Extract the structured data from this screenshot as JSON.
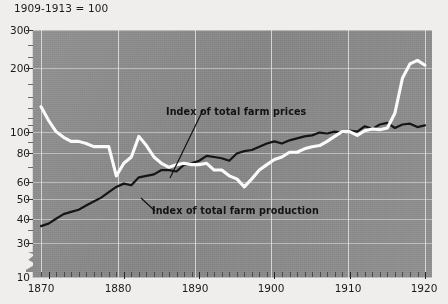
{
  "figure": {
    "title": "1909-1913 = 100",
    "background_color": "#efeeec",
    "plot_background_color": "#8b8b8b"
  },
  "annotations": {
    "prices_label": "Index of total farm prices",
    "production_label": "Index of total farm production"
  },
  "axes": {
    "y_labels": [
      "300",
      "200",
      "100",
      "80",
      "60",
      "50",
      "40",
      "30",
      "10"
    ],
    "x_labels": [
      "1870",
      "1880",
      "1890",
      "1900",
      "1910",
      "1920"
    ]
  },
  "chart_data": {
    "type": "line",
    "title": "1909-1913 = 100",
    "subtitle": "",
    "xlabel": "",
    "ylabel": "",
    "yscale": "log",
    "ylim": [
      28,
      320
    ],
    "xlim": [
      1869,
      1920
    ],
    "yticks": [
      30,
      40,
      50,
      60,
      80,
      100,
      200,
      300
    ],
    "ytick_labels": [
      "30",
      "40",
      "50",
      "60",
      "80",
      "100",
      "200",
      "300"
    ],
    "y_axis_break_below": 30,
    "y_axis_break_label": "10",
    "xticks": [
      1870,
      1880,
      1890,
      1900,
      1910,
      1920
    ],
    "xtick_labels": [
      "1870",
      "1880",
      "1890",
      "1900",
      "1910",
      "1920"
    ],
    "x_minor_tick_interval": 1,
    "grid": true,
    "legend": "inline-annotations",
    "legend_position": "inside-plot",
    "series": [
      {
        "name": "Index of total farm prices",
        "color": "#fbfbfb",
        "linewidth": 3.1,
        "x": [
          1869,
          1870,
          1871,
          1872,
          1873,
          1874,
          1875,
          1876,
          1877,
          1878,
          1879,
          1880,
          1881,
          1882,
          1883,
          1884,
          1885,
          1886,
          1887,
          1888,
          1889,
          1890,
          1891,
          1892,
          1893,
          1894,
          1895,
          1896,
          1897,
          1898,
          1899,
          1900,
          1901,
          1902,
          1903,
          1904,
          1905,
          1906,
          1907,
          1908,
          1909,
          1910,
          1911,
          1912,
          1913,
          1914,
          1915,
          1916,
          1917,
          1918,
          1919,
          1920
        ],
        "values": [
          131,
          113,
          100,
          94,
          90,
          90,
          88,
          85,
          85,
          85,
          62,
          71,
          76,
          95,
          86,
          76,
          71,
          68,
          70,
          71,
          70,
          70,
          71,
          66,
          66,
          62,
          60,
          55,
          60,
          66,
          70,
          74,
          76,
          80,
          80,
          83,
          85,
          86,
          90,
          95,
          100,
          100,
          96,
          101,
          103,
          102,
          104,
          122,
          178,
          208,
          216,
          205
        ]
      },
      {
        "name": "Index of total farm production",
        "color": "#151515",
        "linewidth": 2.2,
        "x": [
          1869,
          1870,
          1871,
          1872,
          1873,
          1874,
          1875,
          1876,
          1877,
          1878,
          1879,
          1880,
          1881,
          1882,
          1883,
          1884,
          1885,
          1886,
          1887,
          1888,
          1889,
          1890,
          1891,
          1892,
          1893,
          1894,
          1895,
          1896,
          1897,
          1898,
          1899,
          1900,
          1901,
          1902,
          1903,
          1904,
          1905,
          1906,
          1907,
          1908,
          1909,
          1910,
          1911,
          1912,
          1913,
          1914,
          1915,
          1916,
          1917,
          1918,
          1919,
          1920
        ],
        "values": [
          36,
          37,
          39,
          41,
          42,
          43,
          45,
          47,
          49,
          52,
          55,
          57,
          56,
          61,
          62,
          63,
          66,
          66,
          65,
          70,
          71,
          73,
          77,
          76,
          75,
          73,
          79,
          81,
          82,
          85,
          88,
          90,
          88,
          91,
          93,
          95,
          96,
          99,
          98,
          100,
          99,
          101,
          100,
          106,
          103,
          108,
          110,
          104,
          108,
          109,
          105,
          107
        ]
      }
    ]
  }
}
